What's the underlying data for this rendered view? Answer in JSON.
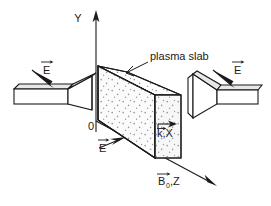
{
  "figure": {
    "title_text": "plasma slab",
    "background_color": "#ffffff",
    "ink_color": "#1a1a1a",
    "stipple_color": "#9a9a9a"
  },
  "axes": {
    "y": {
      "label": "Y",
      "direction": "up",
      "arrow": true
    },
    "x": {
      "label": "k,X",
      "vector_over": "k",
      "direction": "right",
      "arrow": true
    },
    "z": {
      "label": "B",
      "subscript": "0",
      "label_suffix": ",Z",
      "vector_over": "B",
      "direction": "down-right",
      "arrow": true
    },
    "origin": {
      "label": "0"
    }
  },
  "annotations": {
    "slab_label": "plasma slab",
    "field_left": "E",
    "field_right": "E",
    "field_bottom": "E",
    "vector_bar": "→"
  },
  "antennas": [
    {
      "name": "left-horn-antenna",
      "side": "left",
      "field_label": "E"
    },
    {
      "name": "right-horn-antenna",
      "side": "right",
      "field_label": "E"
    }
  ],
  "slab": {
    "name": "plasma-slab",
    "fill_pattern": "stipple",
    "faces": [
      "top",
      "front",
      "end"
    ]
  }
}
